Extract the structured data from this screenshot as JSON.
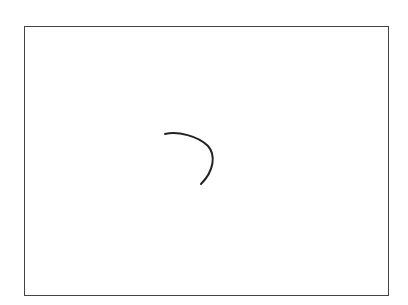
{
  "canvas": {
    "frame": {
      "x": 24,
      "y": 26,
      "width": 365,
      "height": 270,
      "border_color": "#444444"
    },
    "background": "#ffffff"
  },
  "strokes": [
    {
      "name": "curved-stroke",
      "color": "#222222",
      "width": 2,
      "path": "M165,134 C178,131 198,136 208,146 C216,155 214,171 201,184"
    }
  ]
}
